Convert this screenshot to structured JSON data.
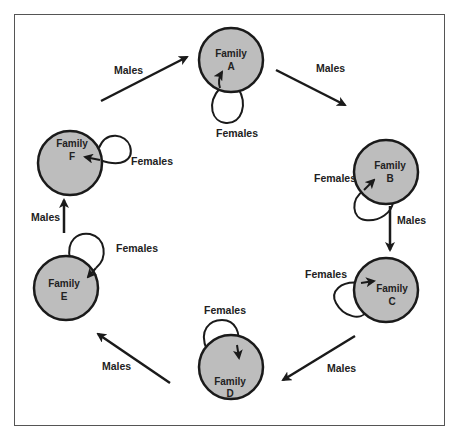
{
  "diagram": {
    "type": "migration-cycle",
    "colors": {
      "node_fill": "#bdbdbd",
      "node_stroke": "#1a1a1a",
      "arrow": "#1a1a1a",
      "frame": "#555555",
      "background": "#ffffff"
    },
    "nodes": [
      {
        "id": "A",
        "line1": "Family",
        "line2": "A",
        "cx": 231,
        "cy": 60
      },
      {
        "id": "B",
        "line1": "Family",
        "line2": "B",
        "cx": 386,
        "cy": 172
      },
      {
        "id": "C",
        "line1": "Family",
        "line2": "C",
        "cx": 386,
        "cy": 290
      },
      {
        "id": "D",
        "line1": "Family",
        "line2": "D",
        "cx": 231,
        "cy": 367
      },
      {
        "id": "E",
        "line1": "Family",
        "line2": "E",
        "cx": 66,
        "cy": 288
      },
      {
        "id": "F",
        "line1": "Family",
        "line2": "F",
        "cx": 70,
        "cy": 163
      }
    ],
    "edges": [
      {
        "from": "A",
        "to": "B",
        "label": "Males"
      },
      {
        "from": "B",
        "to": "C",
        "label": "Males"
      },
      {
        "from": "C",
        "to": "D",
        "label": "Males"
      },
      {
        "from": "D",
        "to": "E",
        "label": "Males"
      },
      {
        "from": "E",
        "to": "F",
        "label": "Males"
      },
      {
        "from": "F",
        "to": "A",
        "label": "Males"
      }
    ],
    "self_loops": [
      {
        "node": "A",
        "label": "Females"
      },
      {
        "node": "B",
        "label": "Females"
      },
      {
        "node": "C",
        "label": "Females"
      },
      {
        "node": "D",
        "label": "Females"
      },
      {
        "node": "E",
        "label": "Females"
      },
      {
        "node": "F",
        "label": "Females"
      }
    ]
  }
}
